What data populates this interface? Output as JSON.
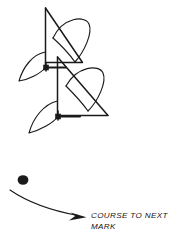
{
  "diagram": {
    "type": "sailing-tactics-diagram",
    "background_color": "#ffffff",
    "ink_color": "#1a1a1a",
    "annotation": {
      "label": "COURSE TO NEXT\nMARK",
      "line1": "COURSE TO NEXT",
      "line2": "MARK",
      "style": "italic-uppercase"
    },
    "mark": {
      "name": "rounding-mark",
      "shape": "filled-circle",
      "x": 23,
      "y": 180,
      "radius": 5
    },
    "course_arrow": {
      "name": "course-to-next-mark-arrow",
      "start_x": 10,
      "start_y": 190,
      "end_x": 86,
      "end_y": 217,
      "arrowhead": "filled-triangle"
    },
    "boats": [
      {
        "name": "boat-upper",
        "mast_base_x": 46,
        "mast_base_y": 67,
        "heading": "down-left",
        "parts": [
          "mast",
          "mainsail",
          "jib",
          "boom",
          "hull-centerline"
        ]
      },
      {
        "name": "boat-lower",
        "mast_base_x": 58,
        "mast_base_y": 116,
        "heading": "down-left",
        "parts": [
          "mast",
          "mainsail",
          "jib",
          "boom",
          "hull-centerline"
        ]
      }
    ]
  }
}
